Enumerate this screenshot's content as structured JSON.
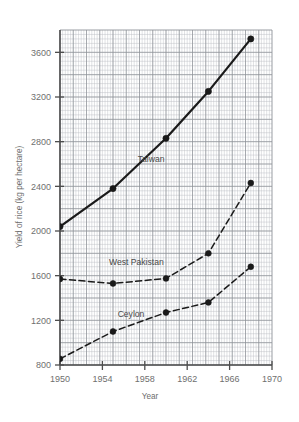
{
  "chart_data": {
    "type": "line",
    "title": "",
    "xlabel": "Year",
    "ylabel": "Yield of rice (kg per hectare)",
    "xlim": [
      1950,
      1970
    ],
    "ylim": [
      800,
      3800
    ],
    "xticks": [
      1950,
      1954,
      1958,
      1962,
      1966,
      1970
    ],
    "yticks": [
      800,
      1200,
      1600,
      2000,
      2400,
      2800,
      3200,
      3600
    ],
    "grid": "graph-paper minor 0.5-unit grid with major lines every 5 minor cells",
    "legend_position": "inline labels on plot",
    "series": [
      {
        "name": "Taiwan",
        "linestyle": "solid",
        "color": "#1a1a1a",
        "label_x": 1958.6,
        "label_y": 2620,
        "x": [
          1950,
          1955,
          1960,
          1964,
          1968
        ],
        "y": [
          2040,
          2380,
          2830,
          3250,
          3720
        ]
      },
      {
        "name": "West Pakistan",
        "linestyle": "dashed",
        "color": "#1a1a1a",
        "label_x": 1957.2,
        "label_y": 1700,
        "x": [
          1950,
          1955,
          1960,
          1964,
          1968
        ],
        "y": [
          1570,
          1530,
          1575,
          1800,
          2430
        ]
      },
      {
        "name": "Ceylon",
        "linestyle": "dashed",
        "color": "#1a1a1a",
        "label_x": 1956.7,
        "label_y": 1230,
        "x": [
          1950,
          1955,
          1960,
          1964,
          1968
        ],
        "y": [
          855,
          1100,
          1270,
          1360,
          1680
        ]
      }
    ]
  },
  "axes": {
    "x_title": "Year",
    "y_title": "Yield of rice (kg per hectare)"
  },
  "colors": {
    "line": "#1a1a1a",
    "grid_minor": "#b9bcc2",
    "grid_major": "#8d9097",
    "axis": "#4d4d4d",
    "text": "#6f6f6f",
    "background": "#ffffff"
  }
}
